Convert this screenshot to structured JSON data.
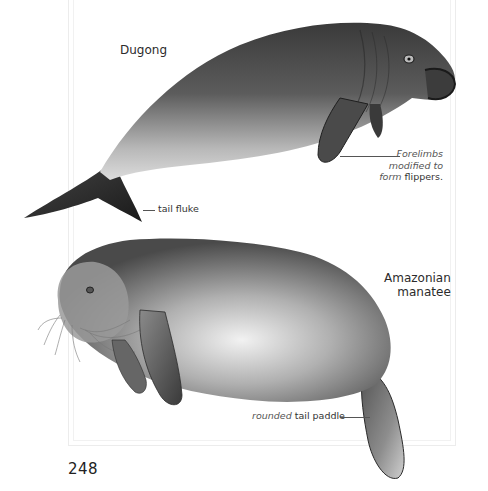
{
  "page": {
    "number": "248"
  },
  "illustrations": [
    {
      "id": "dugong",
      "title": "Dugong",
      "captions": [
        {
          "italic": "Forelimbs modified to form",
          "plain": "flippers.",
          "lines": [
            "Forelimbs",
            "modified to",
            "form"
          ]
        },
        {
          "italic": "",
          "plain": "tail fluke"
        }
      ]
    },
    {
      "id": "amazonian-manatee",
      "title_lines": [
        "Amazonian",
        "manatee"
      ],
      "captions": [
        {
          "italic": "rounded",
          "plain": "tail paddle"
        }
      ]
    }
  ],
  "labels": {
    "dugong_title": "Dugong",
    "manatee_line1": "Amazonian",
    "manatee_line2": "manatee",
    "forelimbs_l1": "Forelimbs",
    "forelimbs_l2": "modified to",
    "forelimbs_l3_italic": "form",
    "forelimbs_l3_plain": "flippers.",
    "fluke": "tail fluke",
    "paddle_italic": "rounded",
    "paddle_plain": "tail paddle"
  },
  "colors": {
    "ink": "#2a2a2a",
    "frame": "#ececec",
    "animal_dark": "#1e1e1e",
    "animal_mid": "#7a7a7a",
    "animal_light": "#d8d8d8"
  }
}
